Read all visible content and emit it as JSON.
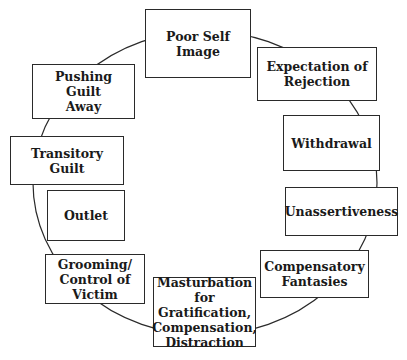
{
  "diagram": {
    "type": "cycle",
    "line_color": "#2a2a2a",
    "nodes": [
      {
        "id": "poor-self-image",
        "label": "Poor Self\nImage",
        "x": 145,
        "y": 9,
        "w": 106,
        "h": 69
      },
      {
        "id": "expectation-of-rejection",
        "label": "Expectation of\nRejection",
        "x": 257,
        "y": 47,
        "w": 120,
        "h": 54
      },
      {
        "id": "withdrawal",
        "label": "Withdrawal",
        "x": 283,
        "y": 115,
        "w": 97,
        "h": 56
      },
      {
        "id": "unassertiveness",
        "label": "Unassertiveness",
        "x": 285,
        "y": 187,
        "w": 113,
        "h": 49
      },
      {
        "id": "compensatory-fantasies",
        "label": "Compensatory\nFantasies",
        "x": 260,
        "y": 250,
        "w": 109,
        "h": 48
      },
      {
        "id": "masturbation",
        "label": "Masturbation\nfor Gratification,\nCompensation,\nDistraction",
        "x": 153,
        "y": 277,
        "w": 103,
        "h": 70
      },
      {
        "id": "grooming-control-of-victim",
        "label": "Grooming/\nControl of\nVictim",
        "x": 45,
        "y": 254,
        "w": 100,
        "h": 50
      },
      {
        "id": "outlet",
        "label": "Outlet",
        "x": 47,
        "y": 190,
        "w": 78,
        "h": 51
      },
      {
        "id": "transitory-guilt",
        "label": "Transitory Guilt",
        "x": 10,
        "y": 136,
        "w": 114,
        "h": 49
      },
      {
        "id": "pushing-guilt-away",
        "label": "Pushing Guilt\nAway",
        "x": 32,
        "y": 64,
        "w": 103,
        "h": 55
      }
    ]
  }
}
